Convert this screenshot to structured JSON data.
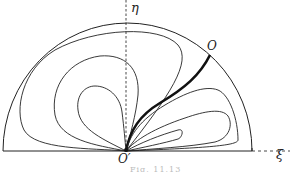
{
  "figure": {
    "axes": {
      "vertical_label": "η",
      "horizontal_label": "ξ"
    },
    "points": {
      "top_point_label": "O",
      "origin_label": "O′"
    },
    "caption": "Fig. 11.13",
    "colors": {
      "stroke": "#222222",
      "background": "#ffffff"
    }
  }
}
